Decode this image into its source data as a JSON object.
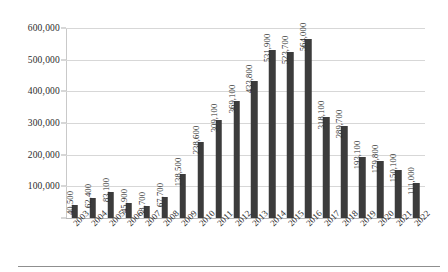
{
  "chart_data": {
    "type": "bar",
    "title": "",
    "subtitle": "",
    "xlabel": "",
    "ylabel": "",
    "categories": [
      "2003",
      "2004",
      "2005",
      "2006",
      "2007",
      "2008",
      "2009",
      "2010",
      "2011",
      "2012",
      "2013",
      "2014",
      "2015",
      "2016",
      "2017",
      "2018",
      "2019",
      "2020",
      "2021",
      "2022"
    ],
    "values": [
      40500,
      62400,
      83100,
      45900,
      38700,
      67700,
      138500,
      238600,
      309100,
      369100,
      433800,
      531900,
      523700,
      564000,
      318100,
      289700,
      193100,
      179800,
      150100,
      111000
    ],
    "value_labels": [
      "40,500",
      "62,400",
      "83,100",
      "45,900",
      "38,700",
      "67,700",
      "138,500",
      "238,600",
      "309,100",
      "369,100",
      "433,800",
      "531,900",
      "523,700",
      "564,000",
      "318,100",
      "289,700",
      "193,100",
      "179,800",
      "150,100",
      "111,000"
    ],
    "ylim": [
      0,
      600000
    ],
    "y_ticks": [
      100000,
      200000,
      300000,
      400000,
      500000,
      600000
    ],
    "y_tick_labels": [
      "100,000",
      "200,000",
      "300,000",
      "400,000",
      "500,000",
      "600,000"
    ],
    "grid": true,
    "legend": false,
    "legend_position": "none",
    "series": [
      {
        "name": "",
        "values": [
          40500,
          62400,
          83100,
          45900,
          38700,
          67700,
          138500,
          238600,
          309100,
          369100,
          433800,
          531900,
          523700,
          564000,
          318100,
          289700,
          193100,
          179800,
          150100,
          111000
        ]
      }
    ],
    "colors": {
      "bar": "#3c3c3c",
      "gridline": "#d7d7d7",
      "axis": "#b8b8b8",
      "text": "#2b2b2b",
      "background": "#ffffff",
      "rule": "#8f8f8f"
    }
  }
}
